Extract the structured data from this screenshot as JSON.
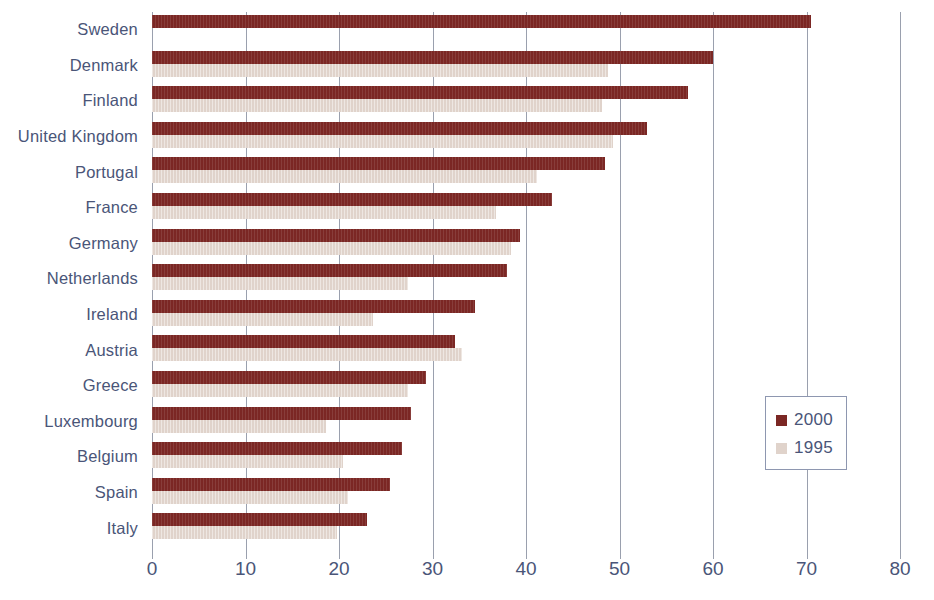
{
  "chart_data": {
    "type": "bar",
    "orientation": "horizontal",
    "title": "",
    "subtitle": "",
    "xlabel": "",
    "ylabel": "",
    "xlim": [
      0,
      80
    ],
    "xticks": [
      0,
      10,
      20,
      30,
      40,
      50,
      60,
      70,
      80
    ],
    "xtick_labels": [
      "0",
      "10",
      "20",
      "30",
      "40",
      "50",
      "60",
      "70",
      "80"
    ],
    "grid": true,
    "grid_axis": "x",
    "legend_position": "right",
    "categories": [
      "Sweden",
      "Denmark",
      "Finland",
      "United Kingdom",
      "Portugal",
      "France",
      "Germany",
      "Netherlands",
      "Ireland",
      "Austria",
      "Greece",
      "Luxembourg",
      "Belgium",
      "Spain",
      "Italy"
    ],
    "series": [
      {
        "name": "2000",
        "color": "#7b2724",
        "values": [
          70.5,
          60.0,
          57.3,
          52.9,
          48.4,
          42.8,
          39.4,
          38.0,
          34.5,
          32.4,
          29.3,
          27.7,
          26.7,
          25.5,
          23.0
        ]
      },
      {
        "name": "1995",
        "color": "#e0d3cb",
        "values": [
          0,
          48.8,
          48.1,
          49.3,
          41.2,
          36.8,
          38.4,
          27.4,
          23.6,
          33.2,
          27.4,
          18.6,
          20.4,
          21.0,
          19.8
        ]
      }
    ]
  },
  "legend": {
    "entries": [
      {
        "label": "2000",
        "color": "#7b2724"
      },
      {
        "label": "1995",
        "color": "#e0d3cb"
      }
    ]
  },
  "colors": {
    "series_2000": "#7b2724",
    "series_1995": "#e0d3cb",
    "text": "#4a5578",
    "gridline": "#9aa0ae",
    "legend_border": "#8e97b0",
    "background": "#ffffff"
  }
}
